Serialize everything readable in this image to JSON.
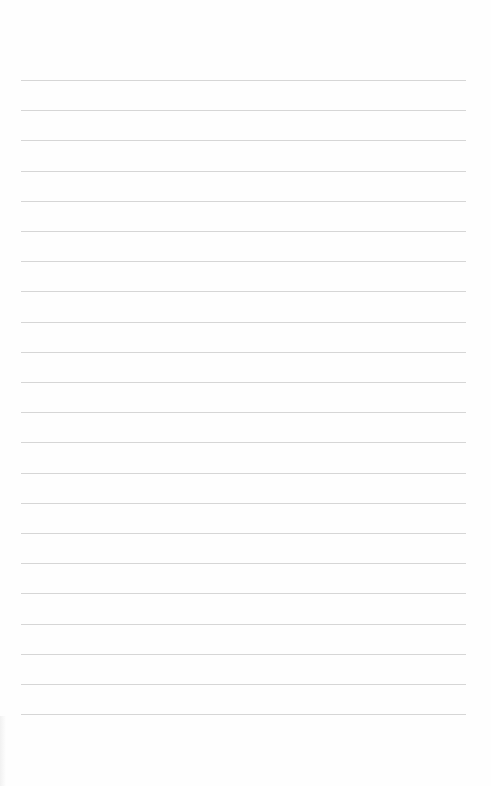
{
  "page": {
    "type": "lined-paper",
    "background_color": "#fefefe",
    "rule_color": "#d6d6d6",
    "rule_count": 22,
    "rule_top_px": 80,
    "rule_spacing_px": 30.2,
    "rule_left_px": 21,
    "rule_width_px": 445
  }
}
